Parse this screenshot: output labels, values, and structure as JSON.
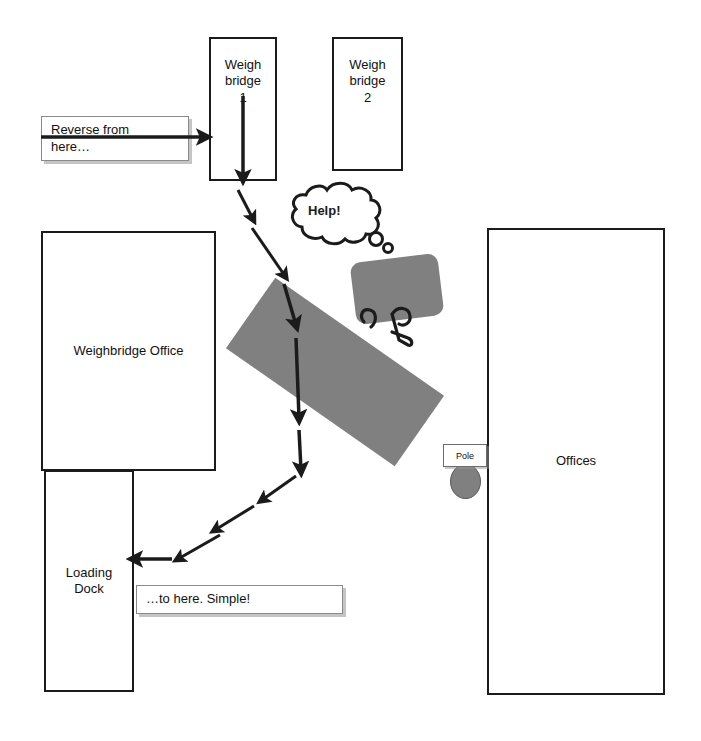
{
  "diagram": {
    "background_color": "#ffffff",
    "line_color": "#1b1b1b",
    "fill_gray": "#808080"
  },
  "zones": [
    {
      "id": "weigh-bridge-1",
      "label": "Weigh\nbridge\n1",
      "x": 209,
      "y": 37,
      "w": 68,
      "h": 144
    },
    {
      "id": "weigh-bridge-2",
      "label": "Weigh\nbridge\n2",
      "x": 332,
      "y": 37,
      "w": 71,
      "h": 134
    },
    {
      "id": "weighbridge-office",
      "label": "Weighbridge Office",
      "x": 41,
      "y": 231,
      "w": 175,
      "h": 240
    },
    {
      "id": "loading-dock",
      "label": "Loading\nDock",
      "x": 44,
      "y": 470,
      "w": 90,
      "h": 222
    },
    {
      "id": "offices",
      "label": "Offices",
      "x": 487,
      "y": 228,
      "w": 178,
      "h": 467
    }
  ],
  "callouts": [
    {
      "id": "reverse-from-here",
      "text": "Reverse from\nhere…",
      "x": 41,
      "y": 116,
      "w": 148,
      "h": 45
    },
    {
      "id": "to-here-simple",
      "text": "…to here. Simple!",
      "x": 136,
      "y": 585,
      "w": 207,
      "h": 29
    }
  ],
  "pole": {
    "label": "Pole",
    "box": {
      "x": 443,
      "y": 444,
      "w": 44,
      "h": 23
    },
    "dot": {
      "x": 450,
      "y": 464,
      "w": 29,
      "h": 33
    }
  },
  "vehicle": {
    "trailer": {
      "x": 232,
      "y": 329,
      "w": 206,
      "h": 86,
      "rotation_deg": 35
    },
    "cab": {
      "x": 353,
      "y": 258,
      "w": 88,
      "h": 62,
      "rotation_deg": -7
    },
    "hitch_color": "#1b1b1b"
  },
  "thought_bubble": {
    "text": "Help!",
    "text_x": 308,
    "text_y": 203,
    "cloud_cx": 334,
    "cloud_cy": 213
  },
  "route_arrows": [
    {
      "id": "entry-arrow",
      "x1": 41,
      "y1": 137,
      "x2": 205,
      "y2": 137,
      "width": 3.5
    },
    {
      "id": "weighbridge-descent-arrow",
      "x1": 243,
      "y1": 96,
      "x2": 243,
      "y2": 178,
      "width": 3.5
    },
    {
      "id": "reverse-arrow-1",
      "x1": 238,
      "y1": 190,
      "x2": 253,
      "y2": 219,
      "width": 3
    },
    {
      "id": "reverse-arrow-2",
      "x1": 252,
      "y1": 228,
      "x2": 285,
      "y2": 276,
      "width": 3
    },
    {
      "id": "reverse-arrow-3",
      "x1": 284,
      "y1": 284,
      "x2": 296,
      "y2": 325,
      "width": 3.5
    },
    {
      "id": "reverse-arrow-4",
      "x1": 296,
      "y1": 338,
      "x2": 299,
      "y2": 418,
      "width": 3.5
    },
    {
      "id": "reverse-arrow-5",
      "x1": 299,
      "y1": 430,
      "x2": 301,
      "y2": 470,
      "width": 3.5
    },
    {
      "id": "reverse-arrow-6",
      "x1": 296,
      "y1": 476,
      "x2": 262,
      "y2": 500,
      "width": 3
    },
    {
      "id": "reverse-arrow-7",
      "x1": 254,
      "y1": 506,
      "x2": 215,
      "y2": 530,
      "width": 3
    },
    {
      "id": "reverse-arrow-8",
      "x1": 220,
      "y1": 535,
      "x2": 178,
      "y2": 559,
      "width": 3
    },
    {
      "id": "dock-arrow",
      "x1": 172,
      "y1": 559,
      "x2": 134,
      "y2": 559,
      "width": 3.5
    }
  ]
}
